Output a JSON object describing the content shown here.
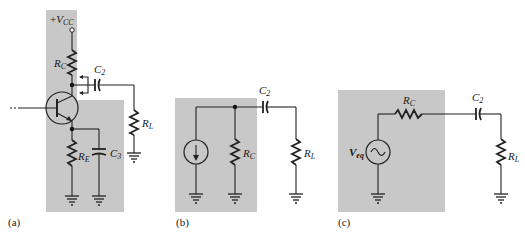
{
  "figure": {
    "panels": [
      {
        "id": "a",
        "caption": "(a)",
        "labels": {
          "vcc_plus": "+",
          "vcc": "V",
          "vcc_sub": "CC",
          "rc": "R",
          "rc_sub": "C",
          "c2": "C",
          "c2_sub": "2",
          "rl": "R",
          "rl_sub": "L",
          "re": "R",
          "re_sub": "E",
          "c3": "C",
          "c3_sub": "3"
        },
        "components": [
          "Vcc terminal",
          "R_C",
          "C_2",
          "R_L",
          "BJT transistor",
          "R_E",
          "C_3",
          "ground x3"
        ]
      },
      {
        "id": "b",
        "caption": "(b)",
        "labels": {
          "c2": "C",
          "c2_sub": "2",
          "rc": "R",
          "rc_sub": "C",
          "rl": "R",
          "rl_sub": "L"
        },
        "components": [
          "current source",
          "R_C",
          "C_2",
          "R_L",
          "ground x3"
        ]
      },
      {
        "id": "c",
        "caption": "(c)",
        "labels": {
          "rc": "R",
          "rc_sub": "C",
          "c2": "C",
          "c2_sub": "2",
          "veq": "V",
          "veq_sub": "eq",
          "rl": "R",
          "rl_sub": "L"
        },
        "components": [
          "AC voltage source V_eq",
          "R_C",
          "C_2",
          "R_L",
          "ground x2"
        ]
      }
    ],
    "colors": {
      "shading": "#c8c8c8",
      "wire": "#222222",
      "background": "#ffffff"
    }
  }
}
